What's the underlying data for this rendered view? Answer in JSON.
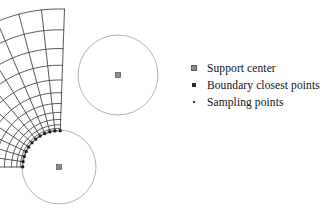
{
  "figure": {
    "title": "",
    "background_color": "#ffffff",
    "mesh_line_color": "#3a3a3a",
    "circle_color": "#9a9a9a",
    "point_color": "#1f1f1f",
    "support_marker_color": "#8d8d8d"
  },
  "legend": {
    "items": [
      {
        "marker": "support-center-marker",
        "label": "Support center",
        "marker_kind": "filled-gray-square",
        "size_px": 6
      },
      {
        "marker": "boundary-closest-points-marker",
        "label": "Boundary closest points",
        "marker_kind": "filled-dark-square",
        "size_px": 4
      },
      {
        "marker": "sampling-points-marker",
        "label": "Sampling points",
        "marker_kind": "tiny-dot",
        "size_px": 2
      }
    ]
  },
  "chart_data": {
    "type": "scatter",
    "title": "",
    "xlabel": "",
    "ylabel": "",
    "grid": false,
    "legend_position": "right",
    "annulus_sector_mesh": {
      "center_x": 59,
      "center_y": 167,
      "inner_radius": 36,
      "outer_radius": 158,
      "start_angle_deg": 180,
      "end_angle_deg": 272,
      "radial_divisions": 12,
      "angular_divisions": 11,
      "radial_grading": 2.15,
      "note": "quarter annulus, graded radially; fine near inner hole"
    },
    "support_domains": [
      {
        "name": "upper-right-support",
        "center_x": 118,
        "center_y": 75,
        "radius": 40,
        "center_marker": "support-center",
        "sampling_point_count": 58,
        "sampling_spacing": 10
      },
      {
        "name": "lower-left-support",
        "center_x": 59,
        "center_y": 167,
        "radius": 37,
        "center_marker": "support-center",
        "sampling_point_count": 64,
        "sampling_spacing": 8,
        "boundary_closest_points": true
      }
    ],
    "series": [
      {
        "name": "Support center",
        "marker": "filled-gray-square",
        "values": [
          [
            118,
            75
          ],
          [
            59,
            167
          ]
        ]
      },
      {
        "name": "Boundary closest points",
        "marker": "filled-dark-square",
        "count": 40
      },
      {
        "name": "Sampling points",
        "marker": "tiny-dot",
        "count": 122
      }
    ]
  }
}
